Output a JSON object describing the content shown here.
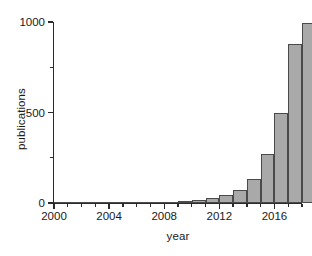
{
  "chart_data": {
    "type": "bar",
    "title": "",
    "xlabel": "year",
    "ylabel": "publications",
    "categories": [
      2000,
      2001,
      2002,
      2003,
      2004,
      2005,
      2006,
      2007,
      2008,
      2009,
      2010,
      2011,
      2012,
      2013,
      2014,
      2015,
      2016,
      2017
    ],
    "values": [
      0,
      0,
      0,
      1,
      1,
      2,
      2,
      3,
      5,
      10,
      15,
      25,
      45,
      70,
      130,
      270,
      500,
      880
    ],
    "xlim": [
      2000,
      2018
    ],
    "ylim": [
      0,
      1000
    ],
    "ytick_labels": [
      "0",
      "500",
      "1000"
    ],
    "ytick_values": [
      0,
      500,
      1000
    ],
    "yminor_values": [
      250,
      750
    ],
    "xtick_labels": [
      "2000",
      "2004",
      "2008",
      "2012",
      "2016"
    ],
    "xtick_values": [
      2000,
      2004,
      2008,
      2012,
      2016
    ],
    "grid": false,
    "legend": false,
    "bar_color": "#a9a9a9",
    "bar_edge_color": "#4a4a4a",
    "background_color": "#ffffff"
  },
  "extra_bar": {
    "year": 2018,
    "value": 995
  }
}
